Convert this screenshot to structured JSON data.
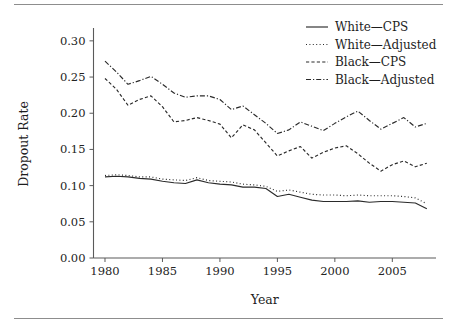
{
  "figure": {
    "background_color": "#ffffff",
    "ink_color": "#2a2a2a",
    "rule_color": "#8d8d8d",
    "has_top_rule": true,
    "has_bottom_rule": true
  },
  "chart_data": {
    "type": "line",
    "title": "",
    "subtitle": "",
    "xlabel": "Year",
    "ylabel": "Dropout Rate",
    "xlim": [
      1979.0,
      2008.8
    ],
    "ylim": [
      0.0,
      0.315
    ],
    "xticks": [
      1980,
      1985,
      1990,
      1995,
      2000,
      2005
    ],
    "xtick_labels": [
      "1980",
      "1985",
      "1990",
      "1995",
      "2000",
      "2005"
    ],
    "yticks": [
      0.0,
      0.05,
      0.1,
      0.15,
      0.2,
      0.25,
      0.3
    ],
    "ytick_labels": [
      "0.00",
      "0.05",
      "0.10",
      "0.15",
      "0.20",
      "0.25",
      "0.30"
    ],
    "grid": false,
    "legend_position": "top-right",
    "legend_frame": false,
    "x": [
      1980,
      1981,
      1982,
      1983,
      1984,
      1985,
      1986,
      1987,
      1988,
      1989,
      1990,
      1991,
      1992,
      1993,
      1994,
      1995,
      1996,
      1997,
      1998,
      1999,
      2000,
      2001,
      2002,
      2003,
      2004,
      2005,
      2006,
      2007,
      2008
    ],
    "series": [
      {
        "name": "White—CPS",
        "style": "solid",
        "color": "#2a2a2a",
        "values": [
          0.112,
          0.113,
          0.112,
          0.11,
          0.109,
          0.106,
          0.104,
          0.103,
          0.108,
          0.104,
          0.102,
          0.101,
          0.098,
          0.098,
          0.096,
          0.085,
          0.088,
          0.084,
          0.08,
          0.078,
          0.078,
          0.078,
          0.079,
          0.077,
          0.078,
          0.078,
          0.077,
          0.076,
          0.068
        ]
      },
      {
        "name": "White—Adjusted",
        "style": "dotted",
        "color": "#2a2a2a",
        "values": [
          0.114,
          0.115,
          0.114,
          0.112,
          0.112,
          0.109,
          0.108,
          0.107,
          0.111,
          0.107,
          0.106,
          0.105,
          0.102,
          0.101,
          0.099,
          0.092,
          0.094,
          0.091,
          0.088,
          0.087,
          0.087,
          0.086,
          0.087,
          0.086,
          0.086,
          0.086,
          0.085,
          0.083,
          0.075
        ]
      },
      {
        "name": "Black—CPS",
        "style": "dashed",
        "color": "#2a2a2a",
        "values": [
          0.248,
          0.233,
          0.211,
          0.219,
          0.224,
          0.209,
          0.188,
          0.19,
          0.194,
          0.19,
          0.185,
          0.166,
          0.184,
          0.177,
          0.159,
          0.141,
          0.148,
          0.154,
          0.138,
          0.146,
          0.152,
          0.155,
          0.144,
          0.131,
          0.12,
          0.129,
          0.134,
          0.126,
          0.131
        ]
      },
      {
        "name": "Black—Adjusted",
        "style": "dashdot",
        "color": "#2a2a2a",
        "values": [
          0.272,
          0.257,
          0.24,
          0.245,
          0.251,
          0.24,
          0.228,
          0.222,
          0.224,
          0.224,
          0.219,
          0.205,
          0.21,
          0.198,
          0.186,
          0.172,
          0.177,
          0.188,
          0.182,
          0.176,
          0.186,
          0.195,
          0.203,
          0.19,
          0.178,
          0.186,
          0.194,
          0.181,
          0.186
        ]
      }
    ]
  },
  "legend": {
    "entries": [
      {
        "label": "White—CPS",
        "style": "solid"
      },
      {
        "label": "White—Adjusted",
        "style": "dotted"
      },
      {
        "label": "Black—CPS",
        "style": "dashed"
      },
      {
        "label": "Black—Adjusted",
        "style": "dashdot"
      }
    ]
  }
}
